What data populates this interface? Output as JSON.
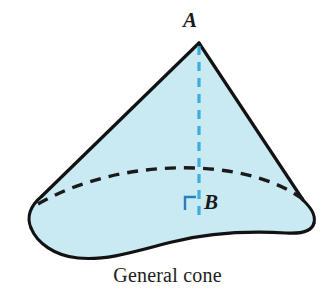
{
  "figure": {
    "caption": "General cone",
    "labels": {
      "apex": "A",
      "base_center": "B"
    },
    "annotations": {
      "right_angle_marker": "right-angle",
      "axis_style": "dashed",
      "hidden_edge_style": "dashed"
    },
    "colors": {
      "solid_fill": "#c9e9f3",
      "outline": "#121212",
      "axis_dashed": "#3aaedd",
      "right_angle_marker": "#2a7fb8",
      "label_text": "#1a1a1a",
      "caption_text": "#1c1c1c",
      "background": "#ffffff"
    },
    "geometry": {
      "apex_point": "199,42",
      "base_center_point": "199,213",
      "left_tip_point": "31,212",
      "right_tip_point": "311,221"
    }
  }
}
